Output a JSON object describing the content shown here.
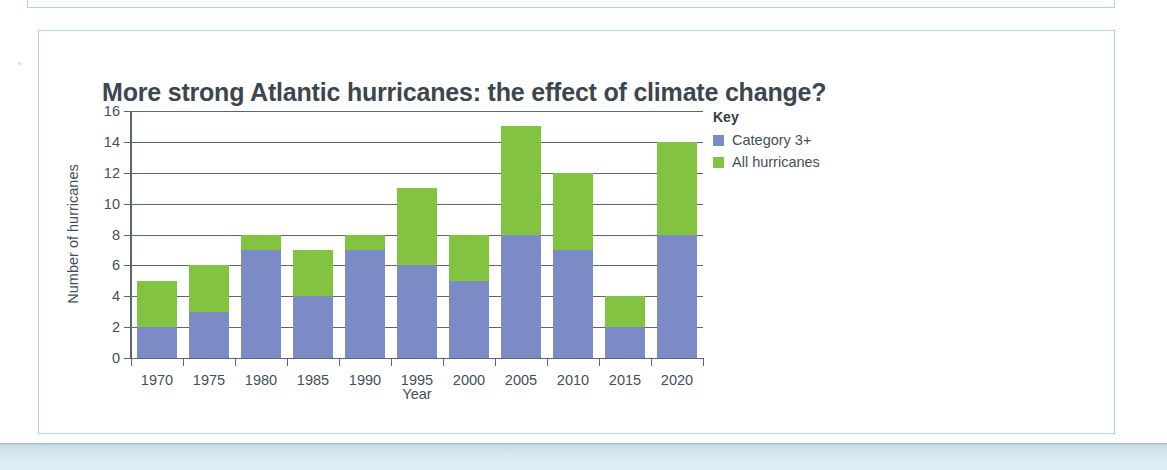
{
  "chart_data": {
    "type": "bar",
    "subtype": "stacked-overlay",
    "title": "More strong Atlantic hurricanes: the effect of climate change?",
    "xlabel": "Year",
    "ylabel": "Number of hurricanes",
    "categories": [
      "1970",
      "1975",
      "1980",
      "1985",
      "1990",
      "1995",
      "2000",
      "2005",
      "2010",
      "2015",
      "2020"
    ],
    "series": [
      {
        "name": "Category 3+",
        "color": "#7c8bc5",
        "values": [
          2,
          3,
          7,
          4,
          7,
          6,
          5,
          8,
          7,
          2,
          8
        ]
      },
      {
        "name": "All hurricanes",
        "color": "#82c341",
        "values": [
          5,
          6,
          8,
          7,
          8,
          11,
          8,
          15,
          12,
          4,
          14
        ]
      }
    ],
    "ylim": [
      0,
      16
    ],
    "ytick_step": 2,
    "yticks": [
      "0",
      "2",
      "4",
      "6",
      "8",
      "10",
      "12",
      "14",
      "16"
    ],
    "grid": true,
    "grid_axis": "y",
    "legend_position": "right"
  },
  "legend": {
    "title": "Key",
    "items": [
      {
        "label": "Category 3+",
        "color": "#7c8bc5"
      },
      {
        "label": "All hurricanes",
        "color": "#82c341"
      }
    ]
  },
  "colors": {
    "frame_border": "#a9d6e2",
    "title_text": "#3b4650",
    "axis": "#5c6670",
    "series_blue": "#7c8bc5",
    "series_green": "#82c341",
    "bottom_band": "#d4e8f2"
  }
}
